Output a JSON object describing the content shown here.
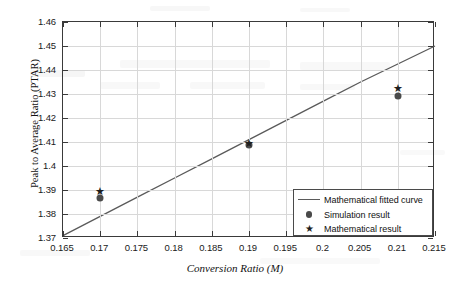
{
  "chart_data": {
    "type": "scatter",
    "title": "",
    "xlabel": "Conversion Ratio (M)",
    "ylabel": "Peak to Average Ratio (PTAR)",
    "xlim": [
      0.165,
      0.215
    ],
    "ylim": [
      1.37,
      1.46
    ],
    "grid": true,
    "legend_position": "bottom-right",
    "xticks": [
      "0.165",
      "0.17",
      "0.175",
      "0.18",
      "0.185",
      "0.19",
      "0.195",
      "0.2",
      "0.205",
      "0.21",
      "0.215"
    ],
    "xtick_values": [
      0.165,
      0.17,
      0.175,
      0.18,
      0.185,
      0.19,
      0.195,
      0.2,
      0.205,
      0.21,
      0.215
    ],
    "yticks": [
      "1.37",
      "1.38",
      "1.39",
      "1.4",
      "1.41",
      "1.42",
      "1.43",
      "1.44",
      "1.45",
      "1.46"
    ],
    "ytick_values": [
      1.37,
      1.38,
      1.39,
      1.4,
      1.41,
      1.42,
      1.43,
      1.44,
      1.45,
      1.46
    ],
    "series": [
      {
        "name": "Mathematical fitted curve",
        "type": "line",
        "marker": "line",
        "color": "#5a5a5a",
        "x": [
          0.165,
          0.17,
          0.175,
          0.18,
          0.185,
          0.19,
          0.195,
          0.2,
          0.205,
          0.21,
          0.215
        ],
        "values": [
          1.371,
          1.379,
          1.387,
          1.395,
          1.403,
          1.411,
          1.419,
          1.427,
          1.435,
          1.4425,
          1.45
        ]
      },
      {
        "name": "Simulation result",
        "type": "scatter",
        "marker": "circle",
        "color": "#4a4a4a",
        "x": [
          0.17,
          0.19,
          0.21
        ],
        "values": [
          1.3865,
          1.4088,
          1.4292
        ]
      },
      {
        "name": "Mathematical result",
        "type": "scatter",
        "marker": "star",
        "color": "#1e1e1e",
        "x": [
          0.17,
          0.19,
          0.21
        ],
        "values": [
          1.3895,
          1.4095,
          1.4325
        ]
      }
    ],
    "legend": [
      {
        "label": "Mathematical fitted curve",
        "marker": "line"
      },
      {
        "label": "Simulation result",
        "marker": "circle"
      },
      {
        "label": "Mathematical result",
        "marker": "star"
      }
    ]
  },
  "icons": {
    "star_glyph": "★"
  }
}
